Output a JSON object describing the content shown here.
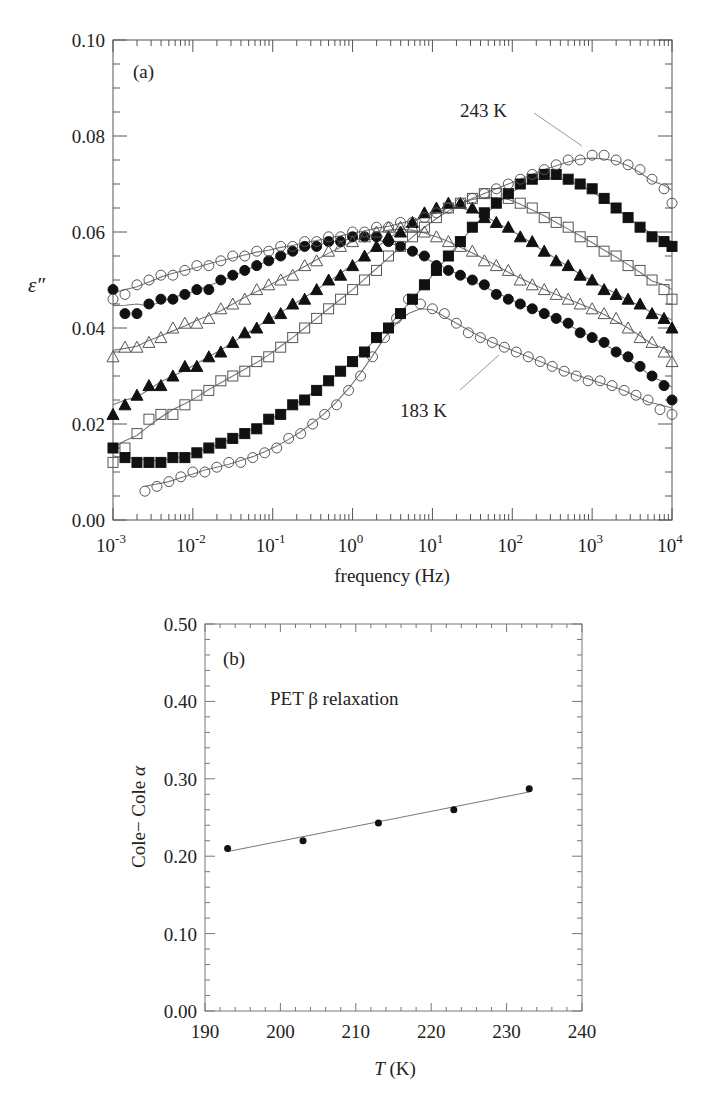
{
  "chart_data": [
    {
      "type": "scatter",
      "panel_label": "(a)",
      "title": "",
      "xlabel": "frequency (Hz)",
      "ylabel": "ε″",
      "xscale": "log",
      "xlim": [
        0.001,
        10000
      ],
      "ylim": [
        0.0,
        0.1
      ],
      "x_tick_labels": [
        "10^-3",
        "10^-2",
        "10^-1",
        "10^0",
        "10^1",
        "10^2",
        "10^3",
        "10^4"
      ],
      "y_tick_labels": [
        "0.00",
        "0.02",
        "0.04",
        "0.06",
        "0.08",
        "0.10"
      ],
      "annotations": [
        {
          "text": "243 K",
          "points_to": "open-circle series, peak near 10^3 Hz"
        },
        {
          "text": "183 K",
          "points_to": "open-circle series, lowest curve at high frequency"
        }
      ],
      "grid": false,
      "legend": "none",
      "fit_lines": true,
      "series": [
        {
          "name": "183 K",
          "marker": "open-circle",
          "x_log": [
            -2.6,
            -2.45,
            -2.3,
            -2.15,
            -2.0,
            -1.85,
            -1.7,
            -1.55,
            -1.4,
            -1.25,
            -1.1,
            -0.95,
            -0.8,
            -0.65,
            -0.5,
            -0.35,
            -0.2,
            -0.05,
            0.1,
            0.25,
            0.4,
            0.55,
            0.7,
            0.85,
            1.0,
            1.15,
            1.3,
            1.45,
            1.6,
            1.75,
            1.9,
            2.05,
            2.2,
            2.35,
            2.5,
            2.65,
            2.8,
            2.95,
            3.1,
            3.25,
            3.4,
            3.55,
            3.7,
            3.85,
            4.0
          ],
          "y": [
            0.006,
            0.007,
            0.008,
            0.009,
            0.01,
            0.01,
            0.011,
            0.012,
            0.012,
            0.013,
            0.014,
            0.015,
            0.017,
            0.018,
            0.02,
            0.022,
            0.024,
            0.027,
            0.03,
            0.034,
            0.038,
            0.042,
            0.046,
            0.045,
            0.044,
            0.043,
            0.041,
            0.039,
            0.038,
            0.037,
            0.036,
            0.035,
            0.034,
            0.033,
            0.032,
            0.031,
            0.03,
            0.029,
            0.029,
            0.028,
            0.027,
            0.026,
            0.025,
            0.023,
            0.022
          ]
        },
        {
          "name": "193 K",
          "marker": "filled-circle",
          "x_log": [
            -3.0,
            -2.85,
            -2.7,
            -2.55,
            -2.4,
            -2.25,
            -2.1,
            -1.95,
            -1.8,
            -1.65,
            -1.5,
            -1.35,
            -1.2,
            -1.05,
            -0.9,
            -0.75,
            -0.6,
            -0.45,
            -0.3,
            -0.15,
            0.0,
            0.15,
            0.3,
            0.45,
            0.6,
            0.75,
            0.9,
            1.05,
            1.2,
            1.35,
            1.5,
            1.65,
            1.8,
            1.95,
            2.1,
            2.25,
            2.4,
            2.55,
            2.7,
            2.85,
            3.0,
            3.15,
            3.3,
            3.45,
            3.6,
            3.75,
            3.9,
            4.0
          ],
          "y": [
            0.048,
            0.043,
            0.043,
            0.045,
            0.046,
            0.046,
            0.047,
            0.048,
            0.048,
            0.05,
            0.051,
            0.052,
            0.053,
            0.054,
            0.055,
            0.056,
            0.057,
            0.057,
            0.058,
            0.058,
            0.059,
            0.059,
            0.059,
            0.058,
            0.057,
            0.056,
            0.055,
            0.053,
            0.052,
            0.051,
            0.05,
            0.049,
            0.047,
            0.046,
            0.045,
            0.044,
            0.043,
            0.042,
            0.041,
            0.039,
            0.038,
            0.037,
            0.035,
            0.034,
            0.032,
            0.03,
            0.028,
            0.025
          ]
        },
        {
          "name": "203 K",
          "marker": "open-triangle",
          "x_log": [
            -3.0,
            -2.85,
            -2.7,
            -2.55,
            -2.4,
            -2.25,
            -2.1,
            -1.95,
            -1.8,
            -1.65,
            -1.5,
            -1.35,
            -1.2,
            -1.05,
            -0.9,
            -0.75,
            -0.6,
            -0.45,
            -0.3,
            -0.15,
            0.0,
            0.15,
            0.3,
            0.45,
            0.6,
            0.75,
            0.9,
            1.05,
            1.2,
            1.35,
            1.5,
            1.65,
            1.8,
            1.95,
            2.1,
            2.25,
            2.4,
            2.55,
            2.7,
            2.85,
            3.0,
            3.15,
            3.3,
            3.45,
            3.6,
            3.75,
            3.9,
            4.0
          ],
          "y": [
            0.034,
            0.036,
            0.036,
            0.037,
            0.038,
            0.04,
            0.041,
            0.041,
            0.042,
            0.044,
            0.045,
            0.046,
            0.048,
            0.049,
            0.05,
            0.051,
            0.053,
            0.054,
            0.056,
            0.057,
            0.058,
            0.059,
            0.06,
            0.061,
            0.061,
            0.061,
            0.06,
            0.059,
            0.058,
            0.057,
            0.056,
            0.054,
            0.053,
            0.052,
            0.05,
            0.049,
            0.048,
            0.047,
            0.046,
            0.045,
            0.044,
            0.043,
            0.042,
            0.04,
            0.038,
            0.037,
            0.035,
            0.033
          ]
        },
        {
          "name": "213 K",
          "marker": "filled-triangle",
          "x_log": [
            -3.0,
            -2.85,
            -2.7,
            -2.55,
            -2.4,
            -2.25,
            -2.1,
            -1.95,
            -1.8,
            -1.65,
            -1.5,
            -1.35,
            -1.2,
            -1.05,
            -0.9,
            -0.75,
            -0.6,
            -0.45,
            -0.3,
            -0.15,
            0.0,
            0.15,
            0.3,
            0.45,
            0.6,
            0.75,
            0.9,
            1.05,
            1.2,
            1.35,
            1.5,
            1.65,
            1.8,
            1.95,
            2.1,
            2.25,
            2.4,
            2.55,
            2.7,
            2.85,
            3.0,
            3.15,
            3.3,
            3.45,
            3.6,
            3.75,
            3.9,
            4.0
          ],
          "y": [
            0.022,
            0.024,
            0.026,
            0.028,
            0.028,
            0.03,
            0.032,
            0.032,
            0.034,
            0.035,
            0.037,
            0.039,
            0.04,
            0.042,
            0.043,
            0.045,
            0.046,
            0.048,
            0.05,
            0.051,
            0.053,
            0.055,
            0.057,
            0.059,
            0.06,
            0.062,
            0.064,
            0.065,
            0.066,
            0.066,
            0.065,
            0.063,
            0.062,
            0.061,
            0.059,
            0.058,
            0.056,
            0.054,
            0.053,
            0.051,
            0.05,
            0.048,
            0.047,
            0.046,
            0.045,
            0.043,
            0.042,
            0.04
          ]
        },
        {
          "name": "223 K",
          "marker": "open-square",
          "x_log": [
            -3.0,
            -2.85,
            -2.7,
            -2.55,
            -2.4,
            -2.25,
            -2.1,
            -1.95,
            -1.8,
            -1.65,
            -1.5,
            -1.35,
            -1.2,
            -1.05,
            -0.9,
            -0.75,
            -0.6,
            -0.45,
            -0.3,
            -0.15,
            0.0,
            0.15,
            0.3,
            0.45,
            0.6,
            0.75,
            0.9,
            1.05,
            1.2,
            1.35,
            1.5,
            1.65,
            1.8,
            1.95,
            2.1,
            2.25,
            2.4,
            2.55,
            2.7,
            2.85,
            3.0,
            3.15,
            3.3,
            3.45,
            3.6,
            3.75,
            3.9,
            4.0
          ],
          "y": [
            0.012,
            0.015,
            0.018,
            0.021,
            0.022,
            0.022,
            0.024,
            0.026,
            0.027,
            0.029,
            0.03,
            0.031,
            0.033,
            0.034,
            0.036,
            0.038,
            0.04,
            0.042,
            0.044,
            0.046,
            0.048,
            0.05,
            0.052,
            0.055,
            0.057,
            0.059,
            0.061,
            0.063,
            0.065,
            0.066,
            0.067,
            0.068,
            0.068,
            0.067,
            0.066,
            0.065,
            0.063,
            0.062,
            0.061,
            0.059,
            0.058,
            0.056,
            0.055,
            0.053,
            0.052,
            0.05,
            0.048,
            0.046
          ]
        },
        {
          "name": "233 K",
          "marker": "filled-square",
          "x_log": [
            -3.0,
            -2.85,
            -2.7,
            -2.55,
            -2.4,
            -2.25,
            -2.1,
            -1.95,
            -1.8,
            -1.65,
            -1.5,
            -1.35,
            -1.2,
            -1.05,
            -0.9,
            -0.75,
            -0.6,
            -0.45,
            -0.3,
            -0.15,
            0.0,
            0.15,
            0.3,
            0.45,
            0.6,
            0.75,
            0.9,
            1.05,
            1.2,
            1.35,
            1.5,
            1.65,
            1.8,
            1.95,
            2.1,
            2.25,
            2.4,
            2.55,
            2.7,
            2.85,
            3.0,
            3.15,
            3.3,
            3.45,
            3.6,
            3.75,
            3.9,
            4.0
          ],
          "y": [
            0.015,
            0.013,
            0.012,
            0.012,
            0.012,
            0.013,
            0.013,
            0.014,
            0.015,
            0.016,
            0.017,
            0.018,
            0.019,
            0.021,
            0.022,
            0.024,
            0.025,
            0.027,
            0.029,
            0.031,
            0.033,
            0.035,
            0.038,
            0.04,
            0.043,
            0.046,
            0.049,
            0.052,
            0.055,
            0.058,
            0.061,
            0.064,
            0.066,
            0.068,
            0.07,
            0.071,
            0.072,
            0.072,
            0.071,
            0.07,
            0.069,
            0.067,
            0.065,
            0.063,
            0.061,
            0.059,
            0.058,
            0.057
          ]
        },
        {
          "name": "243 K",
          "marker": "open-circle",
          "x_log": [
            -3.0,
            -2.85,
            -2.7,
            -2.55,
            -2.4,
            -2.25,
            -2.1,
            -1.95,
            -1.8,
            -1.65,
            -1.5,
            -1.35,
            -1.2,
            -1.05,
            -0.9,
            -0.75,
            -0.6,
            -0.45,
            -0.3,
            -0.15,
            0.0,
            0.15,
            0.3,
            0.45,
            0.6,
            0.75,
            0.9,
            1.05,
            1.2,
            1.35,
            1.5,
            1.65,
            1.8,
            1.95,
            2.1,
            2.25,
            2.4,
            2.55,
            2.7,
            2.85,
            3.0,
            3.15,
            3.3,
            3.45,
            3.6,
            3.75,
            3.9,
            4.0
          ],
          "y": [
            0.046,
            0.047,
            0.049,
            0.05,
            0.051,
            0.051,
            0.052,
            0.053,
            0.053,
            0.054,
            0.055,
            0.055,
            0.056,
            0.056,
            0.057,
            0.057,
            0.058,
            0.058,
            0.059,
            0.059,
            0.06,
            0.06,
            0.061,
            0.061,
            0.062,
            0.062,
            0.063,
            0.064,
            0.065,
            0.066,
            0.067,
            0.068,
            0.069,
            0.07,
            0.071,
            0.072,
            0.073,
            0.074,
            0.075,
            0.075,
            0.076,
            0.076,
            0.075,
            0.074,
            0.073,
            0.071,
            0.069,
            0.066
          ]
        }
      ]
    },
    {
      "type": "scatter",
      "panel_label": "(b)",
      "title": "PET β relaxation",
      "xlabel": "T (K)",
      "ylabel": "Cole− Cole α",
      "xlim": [
        190,
        240
      ],
      "ylim": [
        0.0,
        0.5
      ],
      "x_tick_labels": [
        "190",
        "200",
        "210",
        "220",
        "230",
        "240"
      ],
      "y_tick_labels": [
        "0.00",
        "0.10",
        "0.20",
        "0.30",
        "0.40",
        "0.50"
      ],
      "grid": false,
      "legend": "none",
      "fit_line": {
        "x": [
          193,
          233
        ],
        "y": [
          0.206,
          0.283
        ]
      },
      "series": [
        {
          "name": "Cole-Cole α",
          "marker": "filled-circle",
          "x": [
            193,
            203,
            213,
            223,
            233
          ],
          "y": [
            0.21,
            0.22,
            0.243,
            0.26,
            0.287
          ]
        }
      ]
    }
  ],
  "labels": {
    "panel_a": "(a)",
    "panel_b": "(b)",
    "a_xlabel": "frequency (Hz)",
    "a_ylabel": "ε″",
    "b_title": "PET β relaxation",
    "b_xlabel_italic": "T",
    "b_xlabel_unit": " (K)",
    "b_ylabel_text": "Cole− Cole ",
    "b_ylabel_greek": "α",
    "ann_243": "243 K",
    "ann_183": "183 K"
  }
}
